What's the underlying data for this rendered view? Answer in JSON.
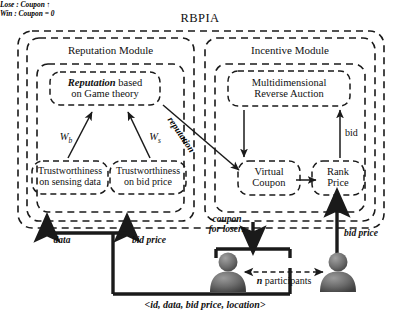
{
  "diagram": {
    "title": "RBPIA",
    "modules": [
      {
        "name": "reputation-module",
        "label": "Reputation Module"
      },
      {
        "name": "incentive-module",
        "label": "Incentive Module"
      }
    ],
    "boxes": {
      "reputation_game": {
        "emphasis": "Reputation",
        "rest": " based",
        "line2": "on Game theory"
      },
      "trust_sensing": {
        "line1": "Trustworthiness",
        "line2": "on sensing data"
      },
      "trust_bid": {
        "line1": "Trustworthiness",
        "line2": "on bid price"
      },
      "reverse_auction": {
        "line1": "Multidimensional",
        "line2": "Reverse Auction"
      },
      "virtual_coupon": {
        "line1": "Virtual",
        "line2": "Coupon"
      },
      "rank_price": {
        "line1": "Rank",
        "line2": "Price"
      }
    },
    "edge_labels": {
      "w_b": "W",
      "w_b_sub": "b",
      "w_s": "W",
      "w_s_sub": "s",
      "reputation_arrow": "reputation",
      "coupon_rule_lose": "Lose : Coupon ↑",
      "coupon_rule_win": "Win : Coupon = 0",
      "bid": "bid",
      "data": "data",
      "bid_price_left": "bid price",
      "bid_price_right": "bid price",
      "coupon_for_losers_l1": "coupon",
      "coupon_for_losers_l2": "for losers",
      "participants_n": "n",
      "participants_rest": " participants",
      "tuple": "<id, data, bid price, location>"
    },
    "icons": [
      {
        "name": "participant-person-icon-left"
      },
      {
        "name": "participant-person-icon-right"
      }
    ],
    "colors": {
      "line": "#1a1a1a",
      "text": "#111111",
      "person_fill": "#6e6e6e",
      "person_fill_dark": "#4a4a4a",
      "background": "#ffffff"
    }
  }
}
